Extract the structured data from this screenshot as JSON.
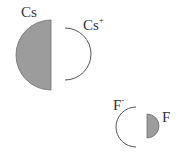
{
  "diagram": {
    "colors": {
      "fill": "#9c9c9c",
      "stroke": "#6e6e6e",
      "outline": "#555555",
      "text": "#333333",
      "background": "#ffffff"
    },
    "shapes": [
      {
        "id": "cs-atom-half",
        "type": "half-disc-left",
        "cx": 51,
        "cy": 55,
        "r": 35,
        "filled": true
      },
      {
        "id": "cs-ion-arc",
        "type": "arc-right",
        "cx": 65,
        "cy": 54,
        "r": 26,
        "filled": false
      },
      {
        "id": "f-ion-arc",
        "type": "arc-left",
        "cx": 136,
        "cy": 127,
        "r": 20,
        "filled": false
      },
      {
        "id": "f-atom-half",
        "type": "half-disc-right",
        "cx": 147,
        "cy": 126,
        "r": 12,
        "filled": true
      }
    ],
    "labels": {
      "cs": {
        "text": "Cs",
        "sup": ""
      },
      "cs_ion": {
        "text": "Cs",
        "sup": "+"
      },
      "f_ion": {
        "text": "F",
        "sup": "-"
      },
      "f": {
        "text": "F",
        "sup": ""
      }
    }
  }
}
